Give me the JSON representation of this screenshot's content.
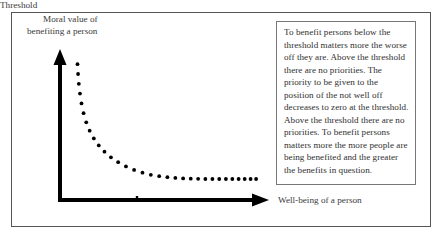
{
  "figure": {
    "background_color": "#ffffff",
    "frame_color": "#555555",
    "axis_color": "#000000",
    "dot_color": "#000000",
    "annotation_border_color": "#777777",
    "text_color": "#2f2f2f"
  },
  "axes": {
    "y_label_line_1": "Moral value of",
    "y_label_line_2": "benefiting a person",
    "x_label": "Well-being of a person",
    "threshold_label": "Threshold"
  },
  "annotation": {
    "text": "To benefit persons below the threshold matters more the worse off they are. Above the threshold there are no priorities. The priority to be given to the position of the not well off decreases to zero at the threshold. Above the threshold there are no priorities. To benefit persons matters more the more people are being benefited and the greater the benefits in question."
  },
  "chart_data": {
    "type": "scatter",
    "title": "",
    "xlabel": "Well-being of a person",
    "ylabel": "Moral value of benefiting a person",
    "grid": false,
    "legend": null,
    "xlim": [
      0,
      100
    ],
    "ylim": [
      0,
      100
    ],
    "annotations": [
      {
        "text": "Threshold",
        "x": 38,
        "y": 0
      }
    ],
    "series": [
      {
        "name": "moral value of benefiting",
        "marker": "dot",
        "x": [
          5.0,
          5.3,
          5.7,
          6.3,
          7.1,
          8.2,
          9.6,
          11.4,
          13.6,
          16.2,
          19.2,
          22.6,
          26.4,
          30.5,
          34.8,
          39.2,
          43.6,
          48.0,
          52.3,
          56.5,
          60.6,
          64.6,
          68.5,
          72.3,
          76.0,
          79.6,
          83.1,
          86.5,
          89.8,
          93.0,
          96.1,
          99.0
        ],
        "y": [
          97.0,
          90.0,
          83.0,
          76.0,
          69.0,
          62.0,
          55.5,
          49.5,
          44.0,
          39.0,
          34.5,
          30.5,
          27.0,
          24.0,
          21.5,
          19.5,
          18.0,
          17.0,
          16.3,
          15.8,
          15.4,
          15.2,
          15.1,
          15.0,
          15.0,
          15.0,
          15.0,
          15.0,
          15.0,
          15.0,
          15.0,
          15.0
        ]
      }
    ]
  }
}
